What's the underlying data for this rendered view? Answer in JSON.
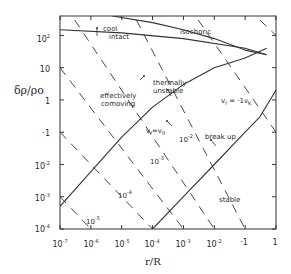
{
  "chart_data": {
    "type": "line",
    "title": "",
    "xlabel": "r/R",
    "ylabel": "δρ/ρo",
    "x_scale": "log",
    "y_scale": "log",
    "xlim": [
      1e-07,
      1
    ],
    "ylim": [
      0.0001,
      400
    ],
    "grid": false,
    "x_ticks": [
      "10^-7",
      "10^-6",
      "10^-5",
      "10^-4",
      "10^-3",
      "10^-2",
      ".1",
      "1"
    ],
    "y_ticks": [
      "10^-4",
      "10^-3",
      "10^-2",
      ".1",
      "1",
      "10",
      "10^2"
    ],
    "series": [
      {
        "name": "v_f = v_0 (effectively comoving / thermally unstable boundary)",
        "style": "solid",
        "x": [
          1e-07,
          1e-06,
          1e-05,
          0.0001,
          0.001,
          0.01,
          0.1,
          0.5
        ],
        "y": [
          0.0005,
          0.006,
          0.07,
          0.6,
          3,
          10,
          20,
          40
        ]
      },
      {
        "name": "v_f = .1 v_K (break up / stable boundary)",
        "style": "solid",
        "x": [
          0.0001,
          0.001,
          0.01,
          0.1,
          0.3,
          1
        ],
        "y": [
          0.0001,
          0.001,
          0.01,
          0.1,
          0.3,
          2
        ]
      },
      {
        "name": "cool intact (lower)",
        "style": "solid",
        "x": [
          1e-07,
          1e-05,
          0.001,
          0.1,
          0.5
        ],
        "y": [
          150,
          120,
          80,
          40,
          25
        ]
      },
      {
        "name": "isochoric (upper)",
        "style": "solid",
        "x": [
          5e-06,
          0.0001,
          0.001,
          0.01,
          0.1,
          0.5
        ],
        "y": [
          400,
          250,
          150,
          80,
          35,
          25
        ]
      },
      {
        "name": "10^-5",
        "style": "dashed",
        "x": [
          1e-07,
          1e-06
        ],
        "y": [
          0.001,
          0.0001
        ]
      },
      {
        "name": "10^-4",
        "style": "dashed",
        "x": [
          1e-07,
          0.0001
        ],
        "y": [
          0.1,
          0.0001
        ]
      },
      {
        "name": "10^-3",
        "style": "dashed",
        "x": [
          1e-07,
          0.001
        ],
        "y": [
          10,
          0.0001
        ]
      },
      {
        "name": "10^-2",
        "style": "dashed",
        "x": [
          3e-07,
          0.01
        ],
        "y": [
          300,
          0.0001
        ]
      },
      {
        "name": "10^-1",
        "style": "dashed",
        "x": [
          3e-05,
          0.1
        ],
        "y": [
          300,
          0.0001
        ]
      },
      {
        "name": "1",
        "style": "dashed",
        "x": [
          0.003,
          1
        ],
        "y": [
          300,
          0.1
        ]
      },
      {
        "name": "10",
        "style": "dashed",
        "x": [
          0.3,
          1
        ],
        "y": [
          300,
          100
        ]
      }
    ],
    "annotations": [
      "cool intact",
      "isochoric",
      "effectively comoving",
      "thermally unstable",
      "v_f = v_0",
      "v_f = .1 v_K",
      "break up",
      "stable",
      "10^-2",
      "10^-3",
      "10^-4",
      "10^-5"
    ]
  },
  "labels": {
    "cool": "cool",
    "intact": "intact",
    "isochoric": "isochoric",
    "effectively": "effectively",
    "comoving": "comoving",
    "thermally": "thermally",
    "unstable": "unstable",
    "vf_v0": "v",
    "vf_v0_rest": "=v",
    "vf_vk": "v",
    "vf_vk_rest": " = ·1v",
    "break_up": "break up",
    "stable": "stable",
    "d2": "10",
    "d3": "10",
    "d4": "10",
    "d5": "10"
  },
  "axes": {
    "xlabel": "r/R",
    "ylabel": "δρ/ρo",
    "y_tick_labels": [
      "10",
      "10",
      "·1",
      "1",
      "10",
      "10",
      "10"
    ],
    "y_tick_exps": [
      "-4",
      "-3",
      "-2",
      "",
      "",
      "",
      "2"
    ],
    "x_tick_labels": [
      "10",
      "10",
      "10",
      "10",
      "10",
      "10",
      "·1",
      "1"
    ],
    "x_tick_exps": [
      "-7",
      "-6",
      "-5",
      "-4",
      "-3",
      "-2",
      "",
      ""
    ]
  }
}
